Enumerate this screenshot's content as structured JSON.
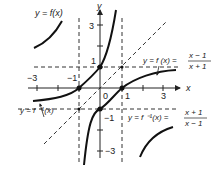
{
  "diagram": {
    "axes": {
      "x_label": "x",
      "y_label": "y",
      "origin_label": "0",
      "x_ticks": [
        {
          "label": "−3",
          "value": -3
        },
        {
          "label": "−1",
          "value": -1
        },
        {
          "label": "1",
          "value": 1
        },
        {
          "label": "3",
          "value": 3
        }
      ],
      "y_ticks": [
        {
          "label": "3",
          "value": 3
        },
        {
          "label": "1",
          "value": 1
        },
        {
          "label": "−1",
          "value": -1
        },
        {
          "label": "−3",
          "value": -3
        }
      ]
    },
    "labels": {
      "f_top": "y = f(x)",
      "f_eq_prefix": "y = f (x) =",
      "f_num": "x − 1",
      "f_den": "x + 1",
      "finv_left": "y = f ⁻¹(x)",
      "finv_eq_prefix": "y = f ⁻¹(x) =",
      "finv_num": "x + 1",
      "finv_den": "x − 1"
    },
    "asymptotes": {
      "f": {
        "vertical": "x = -1",
        "horizontal": "y = 1"
      },
      "f_inverse": {
        "vertical": "x = 1",
        "horizontal": "y = -1"
      },
      "mirror_line": "y = x"
    },
    "marked_points": [
      {
        "x": 0,
        "y": -1
      },
      {
        "x": 1,
        "y": 0
      },
      {
        "x": -1,
        "y": 0
      },
      {
        "x": 0,
        "y": 1
      },
      {
        "x": 1,
        "y": 1
      },
      {
        "x": -1,
        "y": -1
      }
    ],
    "colors": {
      "curve": "#111111",
      "axis": "#222222",
      "dashed": "#333333",
      "background": "#ffffff"
    }
  }
}
